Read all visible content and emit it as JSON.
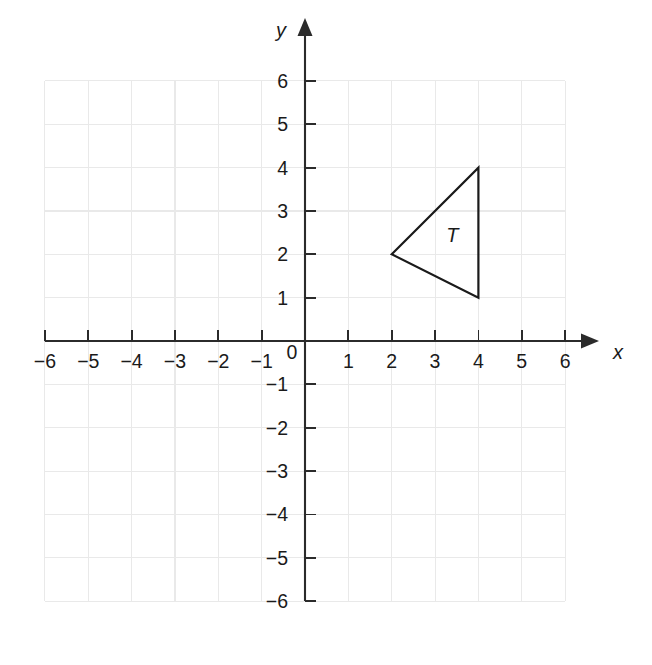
{
  "figure": {
    "background_color": "#ffffff",
    "axis_color": "#2b2b2b",
    "grid_color": "#e9e9e9",
    "shape_color": "#1a1a1a"
  },
  "chart_data": {
    "type": "scatter",
    "title": "",
    "subtitle": "",
    "xlabel": "x",
    "ylabel": "y",
    "xlim": [
      -6,
      6
    ],
    "ylim": [
      -6,
      6
    ],
    "grid": true,
    "legend": "none",
    "x_tick_values": [
      -6,
      -5,
      -4,
      -3,
      -2,
      -1,
      0,
      1,
      2,
      3,
      4,
      5,
      6
    ],
    "y_tick_values": [
      6,
      5,
      4,
      3,
      2,
      1,
      -1,
      -2,
      -3,
      -4,
      -5,
      -6
    ],
    "x_tick_labels": [
      "−6",
      "−5",
      "−4",
      "−3",
      "−2",
      "−1",
      "0",
      "1",
      "2",
      "3",
      "4",
      "5",
      "6"
    ],
    "y_tick_labels": [
      "6",
      "5",
      "4",
      "3",
      "2",
      "1",
      "−1",
      "−2",
      "−3",
      "−4",
      "−5",
      "−6"
    ],
    "origin_label": "0",
    "shapes": [
      {
        "name": "triangle-T",
        "label": "T",
        "label_position": [
          3.4,
          2.4
        ],
        "vertices": [
          [
            2,
            2
          ],
          [
            4,
            4
          ],
          [
            4,
            1
          ]
        ],
        "closed": true,
        "fill": "none",
        "stroke": "#1a1a1a"
      }
    ],
    "annotations": [
      {
        "text": "T",
        "x": 3.4,
        "y": 2.4
      }
    ]
  },
  "axis_labels": {
    "x": "x",
    "y": "y"
  }
}
